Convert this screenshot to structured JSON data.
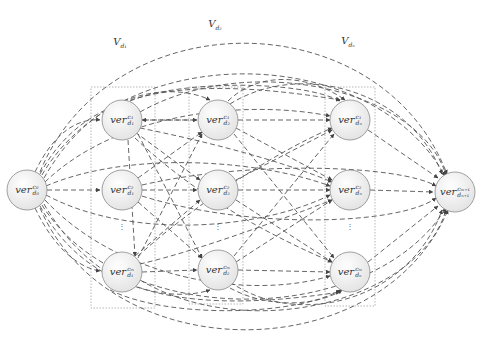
{
  "groups": [
    {
      "id": "V_d1",
      "label": "V",
      "sub": "d₁",
      "x": 120,
      "y": 43
    },
    {
      "id": "V_d2",
      "label": "V",
      "sub": "d₂",
      "x": 215,
      "y": 25
    },
    {
      "id": "V_dn",
      "label": "V",
      "sub": "dₙ",
      "x": 348,
      "y": 42
    }
  ],
  "nodes": {
    "source": {
      "base": "ver",
      "sup": "c₀",
      "sub": "d₀",
      "x": 27,
      "y": 190
    },
    "d1_c1": {
      "base": "ver",
      "sup": "c₁",
      "sub": "d₁",
      "x": 122,
      "y": 120
    },
    "d1_c2": {
      "base": "ver",
      "sup": "c₂",
      "sub": "d₁",
      "x": 122,
      "y": 190
    },
    "d1_cm": {
      "base": "ver",
      "sup": "cₘ",
      "sub": "d₁",
      "x": 122,
      "y": 272
    },
    "d2_c1": {
      "base": "ver",
      "sup": "c₁",
      "sub": "d₂",
      "x": 218,
      "y": 120
    },
    "d2_c2": {
      "base": "ver",
      "sup": "c₂",
      "sub": "d₂",
      "x": 218,
      "y": 190
    },
    "d2_cm": {
      "base": "ver",
      "sup": "cₘ",
      "sub": "d₂",
      "x": 218,
      "y": 270
    },
    "dn_c1": {
      "base": "ver",
      "sup": "c₁",
      "sub": "dₙ",
      "x": 350,
      "y": 120
    },
    "dn_c2": {
      "base": "ver",
      "sup": "c₂",
      "sub": "dₙ",
      "x": 350,
      "y": 190
    },
    "dn_cm": {
      "base": "ver",
      "sup": "cₘ",
      "sub": "dₙ",
      "x": 350,
      "y": 272
    },
    "sink": {
      "base": "ver",
      "sup": "cₘ₊₁",
      "sub": "dₙ₊₁",
      "x": 455,
      "y": 192
    }
  },
  "ellipsis": "⋮",
  "colors": {
    "edge": "#555555",
    "node_fill_top": "#ffffff",
    "node_fill_bottom": "#e6e6e6",
    "node_stroke": "#8a8a8a",
    "box": "#9a9a9a"
  }
}
